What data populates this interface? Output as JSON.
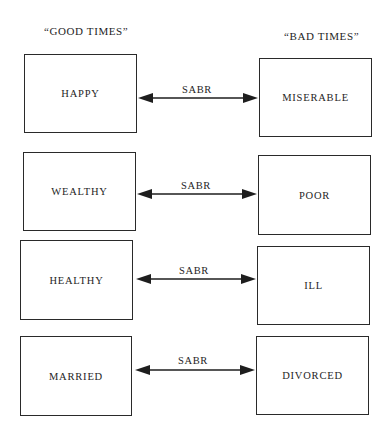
{
  "headers": {
    "left": "“GOOD TIMES”",
    "right": "“BAD TIMES”"
  },
  "rows": [
    {
      "good": "HAPPY",
      "bad": "MISERABLE",
      "link": "SABR"
    },
    {
      "good": "WEALTHY",
      "bad": "POOR",
      "link": "SABR"
    },
    {
      "good": "HEALTHY",
      "bad": "ILL",
      "link": "SABR"
    },
    {
      "good": "MARRIED",
      "bad": "DIVORCED",
      "link": "SABR"
    }
  ],
  "arrow_style": "double-headed",
  "colors": {
    "line": "#1e1e1e",
    "background": "#ffffff"
  }
}
